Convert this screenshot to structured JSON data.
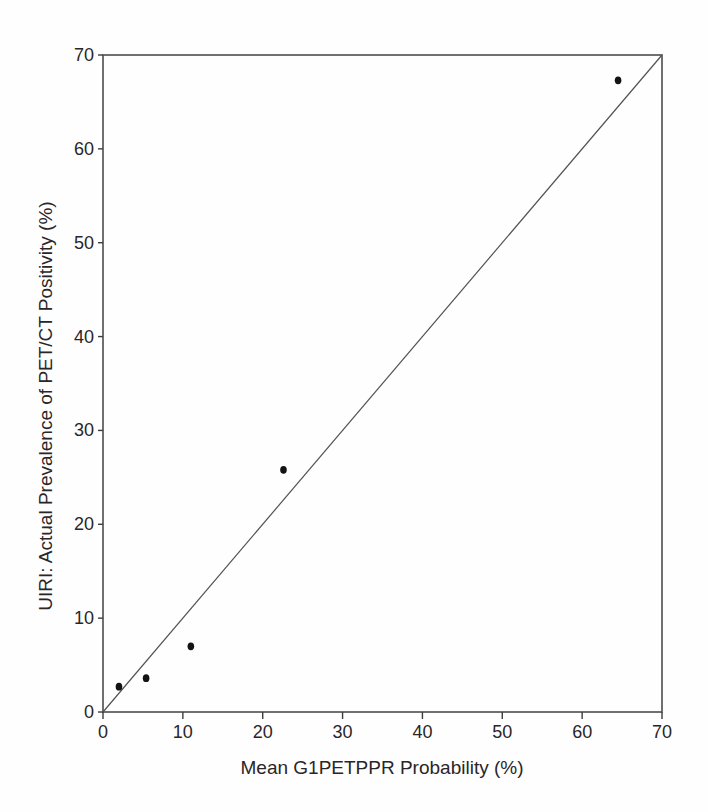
{
  "figure": {
    "background": "#ffffff"
  },
  "chart_data": {
    "type": "scatter",
    "title": "",
    "xlabel": "Mean G1PETPPR Probability (%)",
    "ylabel": "UIRI: Actual Prevalence of PET/CT Positivity (%)",
    "xlim": [
      0,
      70
    ],
    "ylim": [
      0,
      70
    ],
    "xticks": [
      0,
      10,
      20,
      30,
      40,
      50,
      60,
      70
    ],
    "yticks": [
      0,
      10,
      20,
      30,
      40,
      50,
      60,
      70
    ],
    "grid": false,
    "legend": "none",
    "series": [
      {
        "name": "observed-sites",
        "marker": "filled-ellipse",
        "points": [
          {
            "x": 2,
            "y": 2.7
          },
          {
            "x": 5.4,
            "y": 3.6
          },
          {
            "x": 11,
            "y": 7
          },
          {
            "x": 22.6,
            "y": 25.8
          },
          {
            "x": 64.5,
            "y": 67.3
          }
        ]
      }
    ],
    "reference_line": {
      "name": "identity-line",
      "x1": 0,
      "y1": 0,
      "x2": 70,
      "y2": 70
    },
    "colors": {
      "frame": "#4d4d4d",
      "tick": "#3c3c3c",
      "text": "#2a2628",
      "point": "#141214",
      "reference_line": "#525252",
      "background": "#ffffff"
    }
  }
}
